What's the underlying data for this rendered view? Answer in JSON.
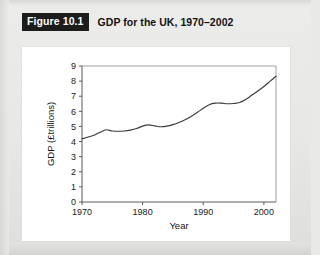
{
  "figure": {
    "badge_label": "Figure 10.1",
    "caption": "GDP for the UK, 1970–2002"
  },
  "colors": {
    "page_background": "#e9e9e7",
    "panel_background": "#ffffff",
    "badge_background": "#1c1c1c",
    "badge_text": "#ffffff",
    "caption_text": "#131313",
    "axis": "#4a4a4a",
    "frame": "#8c8c8c",
    "data_line": "#3a3a3a"
  },
  "chart_data": {
    "type": "line",
    "title": "GDP for the UK, 1970–2002",
    "xlabel": "Year",
    "ylabel": "GDP (£trillions)",
    "xlim": [
      1970,
      2002
    ],
    "ylim": [
      0,
      9
    ],
    "xticks": [
      1970,
      1980,
      1990,
      2000
    ],
    "xtick_labels": [
      "1970",
      "1980",
      "1990",
      "2000"
    ],
    "yticks": [
      0,
      1,
      2,
      3,
      4,
      5,
      6,
      7,
      8,
      9
    ],
    "ytick_labels": [
      "0",
      "1",
      "2",
      "3",
      "4",
      "5",
      "6",
      "7",
      "8",
      "9"
    ],
    "grid": false,
    "legend": false,
    "series": [
      {
        "name": "GDP",
        "x": [
          1970,
          1971,
          1972,
          1973,
          1974,
          1975,
          1976,
          1977,
          1978,
          1979,
          1980,
          1981,
          1982,
          1983,
          1984,
          1985,
          1986,
          1987,
          1988,
          1989,
          1990,
          1991,
          1992,
          1993,
          1994,
          1995,
          1996,
          1997,
          1998,
          1999,
          2000,
          2001,
          2002
        ],
        "values": [
          4.18,
          4.3,
          4.42,
          4.62,
          4.78,
          4.7,
          4.68,
          4.7,
          4.76,
          4.86,
          5.02,
          5.1,
          5.04,
          4.98,
          5.02,
          5.12,
          5.26,
          5.44,
          5.66,
          5.92,
          6.2,
          6.44,
          6.54,
          6.54,
          6.5,
          6.52,
          6.58,
          6.78,
          7.06,
          7.34,
          7.64,
          7.98,
          8.32
        ]
      }
    ]
  },
  "axis_label_positions": {
    "note": "plot box corners in panel coordinates",
    "plot_left": 60,
    "plot_right": 254,
    "plot_top": 19,
    "plot_bottom": 155
  }
}
